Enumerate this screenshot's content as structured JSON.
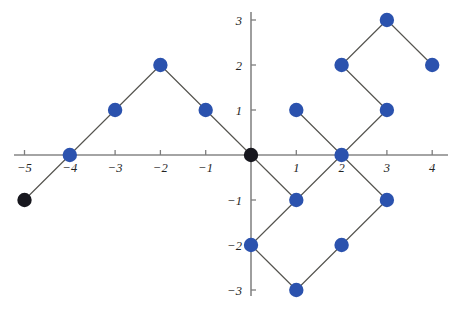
{
  "chart_data": {
    "type": "scatter",
    "title": "",
    "subtitle": "",
    "xlabel": "",
    "ylabel": "",
    "xlim": [
      -5.6,
      4.6
    ],
    "ylim": [
      -3.45,
      3.45
    ],
    "grid": false,
    "legend": null,
    "x_ticks": [
      -5,
      -4,
      -3,
      -2,
      -1,
      1,
      2,
      3,
      4
    ],
    "y_ticks": [
      -3,
      -2,
      -1,
      1,
      2,
      3
    ],
    "x_tick_labels": [
      "−5",
      "−4",
      "−3",
      "−2",
      "−1",
      "1",
      "2",
      "3",
      "4"
    ],
    "y_tick_labels": [
      "−3",
      "−2",
      "−1",
      "1",
      "2",
      "3"
    ],
    "colors": {
      "point_primary": "#2b52ae",
      "point_highlight": "#17171e",
      "edge": "#55544f",
      "axis": "#868686",
      "background": "#ffffff"
    },
    "point_radius": 7.2,
    "series": [
      {
        "name": "vertices",
        "points": [
          {
            "x": -5,
            "y": -1,
            "color": "black",
            "label": ""
          },
          {
            "x": -4,
            "y": 0,
            "color": "blue",
            "label": ""
          },
          {
            "x": -3,
            "y": 1,
            "color": "blue",
            "label": ""
          },
          {
            "x": -2,
            "y": 2,
            "color": "blue",
            "label": ""
          },
          {
            "x": -1,
            "y": 1,
            "color": "blue",
            "label": ""
          },
          {
            "x": 0,
            "y": 0,
            "color": "black",
            "label": ""
          },
          {
            "x": 1,
            "y": -1,
            "color": "blue",
            "label": ""
          },
          {
            "x": 0,
            "y": -2,
            "color": "blue",
            "label": ""
          },
          {
            "x": 1,
            "y": -3,
            "color": "blue",
            "label": ""
          },
          {
            "x": 2,
            "y": -2,
            "color": "blue",
            "label": ""
          },
          {
            "x": 3,
            "y": -1,
            "color": "blue",
            "label": ""
          },
          {
            "x": 2,
            "y": 0,
            "color": "blue",
            "label": ""
          },
          {
            "x": 1,
            "y": 1,
            "color": "blue",
            "label": ""
          },
          {
            "x": 3,
            "y": 1,
            "color": "blue",
            "label": ""
          },
          {
            "x": 2,
            "y": 2,
            "color": "blue",
            "label": ""
          },
          {
            "x": 3,
            "y": 3,
            "color": "blue",
            "label": ""
          },
          {
            "x": 4,
            "y": 2,
            "color": "blue",
            "label": ""
          }
        ]
      }
    ],
    "edges": [
      {
        "x1": -5,
        "y1": -1,
        "x2": -4,
        "y2": 0
      },
      {
        "x1": -4,
        "y1": 0,
        "x2": -3,
        "y2": 1
      },
      {
        "x1": -3,
        "y1": 1,
        "x2": -2,
        "y2": 2
      },
      {
        "x1": -2,
        "y1": 2,
        "x2": -1,
        "y2": 1
      },
      {
        "x1": -1,
        "y1": 1,
        "x2": 0,
        "y2": 0
      },
      {
        "x1": 0,
        "y1": 0,
        "x2": 1,
        "y2": -1
      },
      {
        "x1": 1,
        "y1": -1,
        "x2": 0,
        "y2": -2
      },
      {
        "x1": 0,
        "y1": -2,
        "x2": 1,
        "y2": -3
      },
      {
        "x1": 1,
        "y1": -3,
        "x2": 2,
        "y2": -2
      },
      {
        "x1": 2,
        "y1": -2,
        "x2": 3,
        "y2": -1
      },
      {
        "x1": 3,
        "y1": -1,
        "x2": 2,
        "y2": 0
      },
      {
        "x1": 2,
        "y1": 0,
        "x2": 1,
        "y2": -1
      },
      {
        "x1": 2,
        "y1": 0,
        "x2": 1,
        "y2": 1
      },
      {
        "x1": 2,
        "y1": 0,
        "x2": 3,
        "y2": 1
      },
      {
        "x1": 3,
        "y1": 1,
        "x2": 2,
        "y2": 2
      },
      {
        "x1": 2,
        "y1": 2,
        "x2": 3,
        "y2": 3
      },
      {
        "x1": 3,
        "y1": 3,
        "x2": 4,
        "y2": 2
      }
    ],
    "geometry": {
      "origin_px_x": 251,
      "origin_px_y": 155,
      "unit_px_x": 45.3,
      "unit_px_y": 45.0,
      "x_axis_start_px": 14,
      "x_axis_end_px": 448,
      "y_axis_top_px": 12,
      "y_axis_bottom_px": 296,
      "tick_len_px": 5
    }
  }
}
